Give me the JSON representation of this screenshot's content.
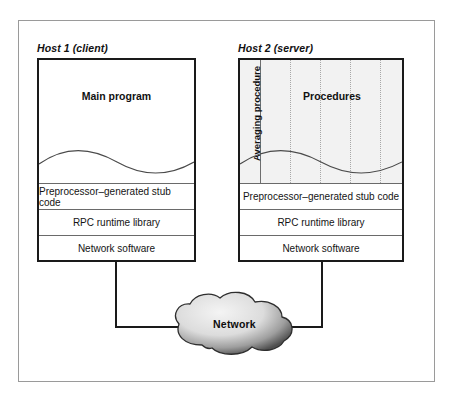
{
  "diagram": {
    "host1": {
      "title": "Host 1 (client)",
      "upper_label": "Main program",
      "layers": [
        "Preprocessor–generated stub code",
        "RPC runtime library",
        "Network software"
      ]
    },
    "host2": {
      "title": "Host 2 (server)",
      "upper_label": "Procedures",
      "side_label": "Averaging procedure",
      "layers": [
        "Preprocessor–generated stub code",
        "RPC runtime library",
        "Network software"
      ]
    },
    "network": {
      "label": "Network"
    },
    "colors": {
      "frame_border": "#9a9a9a",
      "box_border": "#1a1a1a",
      "box_shadow": "#3a3a3a",
      "procedures_fill": "#f2f2f2",
      "dotted_separator": "#a8a8a8",
      "connector": "#1a1a1a",
      "cloud_light": "#e8e8e8",
      "cloud_dark": "#4a4a4a"
    }
  }
}
